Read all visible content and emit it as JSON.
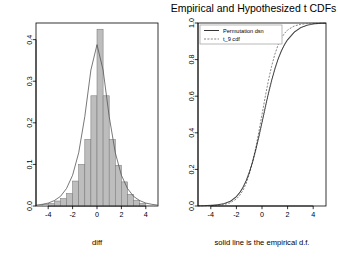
{
  "figure": {
    "width": 338,
    "height": 268,
    "background": "#ffffff",
    "foreground": "#000000",
    "hist_fill": "#bdbdbd",
    "hist_border": "#7a7a7a"
  },
  "left_panel": {
    "title": "",
    "xlabel": "diff",
    "ylabel": "",
    "xticks": [
      "-4",
      "-2",
      "0",
      "2",
      "4"
    ],
    "yticks": [
      "0.0",
      "0.1",
      "0.2",
      "0.3",
      "0.4"
    ]
  },
  "right_panel": {
    "title": "Empirical and Hypothesized t CDFs",
    "xlabel": "solid line is the empirical d.f.",
    "ylabel": "",
    "xticks": [
      "-4",
      "-2",
      "0",
      "2",
      "4"
    ],
    "yticks": [
      "0.0",
      "0.2",
      "0.4",
      "0.6",
      "0.8",
      "1.0"
    ],
    "legend": {
      "items": [
        {
          "label": "Permutation dsn",
          "style": "solid"
        },
        {
          "label": "t_9 cdf",
          "style": "dashed"
        }
      ]
    }
  },
  "chart_data": [
    {
      "type": "bar",
      "id": "histogram-density",
      "title": "",
      "xlabel": "diff",
      "ylabel": "",
      "xlim": [
        -5.0,
        5.0
      ],
      "ylim": [
        0.0,
        0.44
      ],
      "xticks": [
        -4,
        -2,
        0,
        2,
        4
      ],
      "yticks": [
        0.0,
        0.1,
        0.2,
        0.3,
        0.4
      ],
      "grid": false,
      "bin_width": 0.5,
      "bin_edges": [
        -4.5,
        -4.0,
        -3.5,
        -3.0,
        -2.5,
        -2.0,
        -1.5,
        -1.0,
        -0.5,
        0.0,
        0.5,
        1.0,
        1.5,
        2.0,
        2.5,
        3.0,
        3.5,
        4.0
      ],
      "categories": [
        "-4.25",
        "-3.75",
        "-3.25",
        "-2.75",
        "-2.25",
        "-1.75",
        "-1.25",
        "-0.75",
        "-0.25",
        "0.25",
        "0.75",
        "1.25",
        "1.75",
        "2.25",
        "2.75",
        "3.25",
        "3.75"
      ],
      "values": [
        0.004,
        0.006,
        0.012,
        0.018,
        0.03,
        0.06,
        0.1,
        0.16,
        0.265,
        0.425,
        0.265,
        0.16,
        0.098,
        0.058,
        0.028,
        0.014,
        0.006
      ],
      "overlay_curve": {
        "name": "t density",
        "style": "solid",
        "type": "line",
        "x": [
          -5.0,
          -4.5,
          -4.0,
          -3.5,
          -3.0,
          -2.5,
          -2.0,
          -1.5,
          -1.0,
          -0.5,
          0.0,
          0.5,
          1.0,
          1.5,
          2.0,
          2.5,
          3.0,
          3.5,
          4.0,
          4.5,
          5.0
        ],
        "y": [
          0.002,
          0.004,
          0.007,
          0.013,
          0.023,
          0.042,
          0.074,
          0.128,
          0.215,
          0.327,
          0.388,
          0.327,
          0.215,
          0.128,
          0.074,
          0.042,
          0.023,
          0.013,
          0.007,
          0.004,
          0.002
        ]
      }
    },
    {
      "type": "line",
      "id": "cdf-comparison",
      "title": "Empirical and Hypothesized t CDFs",
      "xlabel": "solid line is the empirical d.f.",
      "ylabel": "",
      "xlim": [
        -5.0,
        5.0
      ],
      "ylim": [
        0.0,
        1.0
      ],
      "xticks": [
        -4,
        -2,
        0,
        2,
        4
      ],
      "yticks": [
        0.0,
        0.2,
        0.4,
        0.6,
        0.8,
        1.0
      ],
      "grid": false,
      "legend_position": "top-left",
      "x": [
        -5.0,
        -4.5,
        -4.0,
        -3.5,
        -3.0,
        -2.5,
        -2.0,
        -1.75,
        -1.5,
        -1.25,
        -1.0,
        -0.75,
        -0.5,
        -0.25,
        0.0,
        0.25,
        0.5,
        0.75,
        1.0,
        1.25,
        1.5,
        1.75,
        2.0,
        2.5,
        3.0,
        3.5,
        4.0,
        4.5,
        5.0
      ],
      "series": [
        {
          "name": "Permutation dsn",
          "style": "solid",
          "values": [
            0.001,
            0.002,
            0.004,
            0.007,
            0.013,
            0.026,
            0.053,
            0.074,
            0.102,
            0.139,
            0.186,
            0.242,
            0.308,
            0.383,
            0.462,
            0.543,
            0.62,
            0.69,
            0.752,
            0.805,
            0.848,
            0.883,
            0.911,
            0.951,
            0.975,
            0.988,
            0.995,
            0.998,
            0.999
          ]
        },
        {
          "name": "t_9 cdf",
          "style": "dashed",
          "values": [
            0.0004,
            0.0008,
            0.0015,
            0.0034,
            0.0075,
            0.0169,
            0.0383,
            0.0573,
            0.0839,
            0.1209,
            0.1717,
            0.2363,
            0.3143,
            0.4042,
            0.5,
            0.5958,
            0.6857,
            0.7637,
            0.8283,
            0.8791,
            0.9161,
            0.9427,
            0.9617,
            0.9831,
            0.9925,
            0.9966,
            0.9985,
            0.9992,
            0.9996
          ]
        }
      ]
    }
  ]
}
